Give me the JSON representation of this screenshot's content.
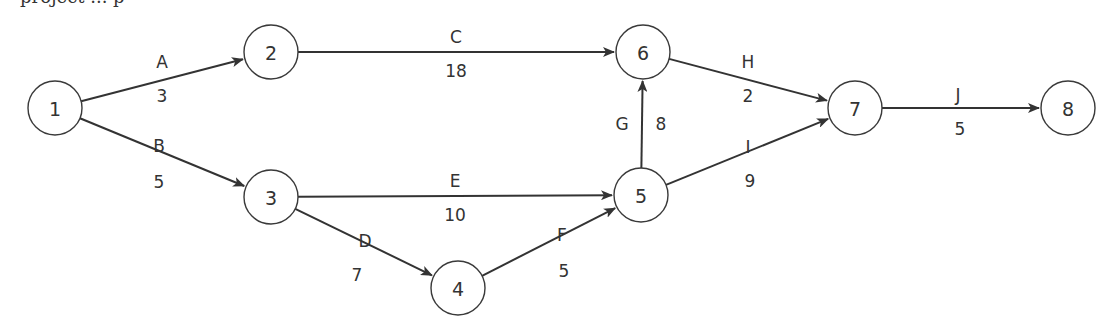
{
  "diagram": {
    "type": "activity-on-arrow network",
    "caption_fragment": "project ... p",
    "nodes": [
      {
        "id": "1",
        "label": "1",
        "x": 55,
        "y": 108
      },
      {
        "id": "2",
        "label": "2",
        "x": 271,
        "y": 52
      },
      {
        "id": "3",
        "label": "3",
        "x": 271,
        "y": 197
      },
      {
        "id": "4",
        "label": "4",
        "x": 458,
        "y": 288
      },
      {
        "id": "5",
        "label": "5",
        "x": 641,
        "y": 195
      },
      {
        "id": "6",
        "label": "6",
        "x": 643,
        "y": 52
      },
      {
        "id": "7",
        "label": "7",
        "x": 855,
        "y": 108
      },
      {
        "id": "8",
        "label": "8",
        "x": 1068,
        "y": 108
      }
    ],
    "edges": [
      {
        "activity": "A",
        "duration": "3",
        "from": "1",
        "to": "2",
        "name_pos": [
          162,
          62
        ],
        "dur_pos": [
          162,
          96
        ]
      },
      {
        "activity": "B",
        "duration": "5",
        "from": "1",
        "to": "3",
        "name_pos": [
          159,
          146
        ],
        "dur_pos": [
          159,
          182
        ]
      },
      {
        "activity": "C",
        "duration": "18",
        "from": "2",
        "to": "6",
        "name_pos": [
          456,
          37
        ],
        "dur_pos": [
          456,
          71
        ]
      },
      {
        "activity": "D",
        "duration": "7",
        "from": "3",
        "to": "4",
        "name_pos": [
          365,
          241
        ],
        "dur_pos": [
          357,
          275
        ]
      },
      {
        "activity": "E",
        "duration": "10",
        "from": "3",
        "to": "5",
        "name_pos": [
          455,
          181
        ],
        "dur_pos": [
          455,
          215
        ]
      },
      {
        "activity": "F",
        "duration": "5",
        "from": "4",
        "to": "5",
        "name_pos": [
          562,
          235
        ],
        "dur_pos": [
          564,
          271
        ]
      },
      {
        "activity": "G",
        "duration": "8",
        "from": "5",
        "to": "6",
        "name_pos": [
          622,
          124
        ],
        "dur_pos": [
          661,
          124
        ]
      },
      {
        "activity": "H",
        "duration": "2",
        "from": "6",
        "to": "7",
        "name_pos": [
          748,
          62
        ],
        "dur_pos": [
          748,
          96
        ]
      },
      {
        "activity": "I",
        "duration": "9",
        "from": "5",
        "to": "7",
        "name_pos": [
          748,
          147
        ],
        "dur_pos": [
          750,
          181
        ]
      },
      {
        "activity": "J",
        "duration": "5",
        "from": "7",
        "to": "8",
        "name_pos": [
          958,
          95
        ],
        "dur_pos": [
          960,
          129
        ]
      }
    ],
    "style": {
      "node_radius": 27,
      "stroke_color": "#333333",
      "background": "#ffffff"
    }
  }
}
